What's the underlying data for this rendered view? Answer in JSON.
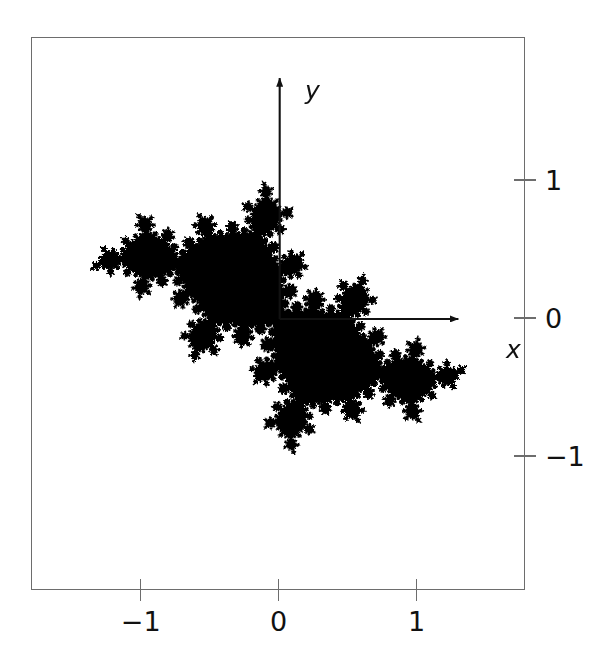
{
  "figure": {
    "kind": "julia-set-plot",
    "background_color": "#ffffff",
    "set_color": "#000000",
    "frame_color": "#6d6d6d",
    "axis_color": "#111111"
  },
  "axes": {
    "x_name": "x",
    "y_name": "y",
    "x_ticks": [
      {
        "label": "−1",
        "value": -1
      },
      {
        "label": "0",
        "value": 0
      },
      {
        "label": "1",
        "value": 1
      }
    ],
    "y_ticks": [
      {
        "label": "1",
        "value": 1
      },
      {
        "label": "0",
        "value": 0
      },
      {
        "label": "−1",
        "value": -1
      }
    ],
    "x_arrow_from": 0,
    "x_arrow_to": 1.295,
    "y_arrow_from": 0,
    "y_arrow_to": 1.745
  },
  "chart_data": {
    "type": "scatter",
    "title": "",
    "xlabel": "x",
    "ylabel": "y",
    "grid": false,
    "legend": false,
    "xlim": [
      -1.795,
      1.785
    ],
    "ylim": [
      -1.97,
      2.035
    ],
    "xtick_labels": [
      "−1",
      "0",
      "1"
    ],
    "xtick_values": [
      -1,
      0,
      1
    ],
    "ytick_labels": [
      "1",
      "0",
      "−1"
    ],
    "ytick_values": [
      1,
      0,
      -1
    ],
    "julia": {
      "formula": "z_{n+1} = z_n^2 + c",
      "c_real": -0.3905,
      "c_imag": 0.5868,
      "max_iterations": 120,
      "escape_radius": 2.0,
      "supersample": 2
    }
  }
}
